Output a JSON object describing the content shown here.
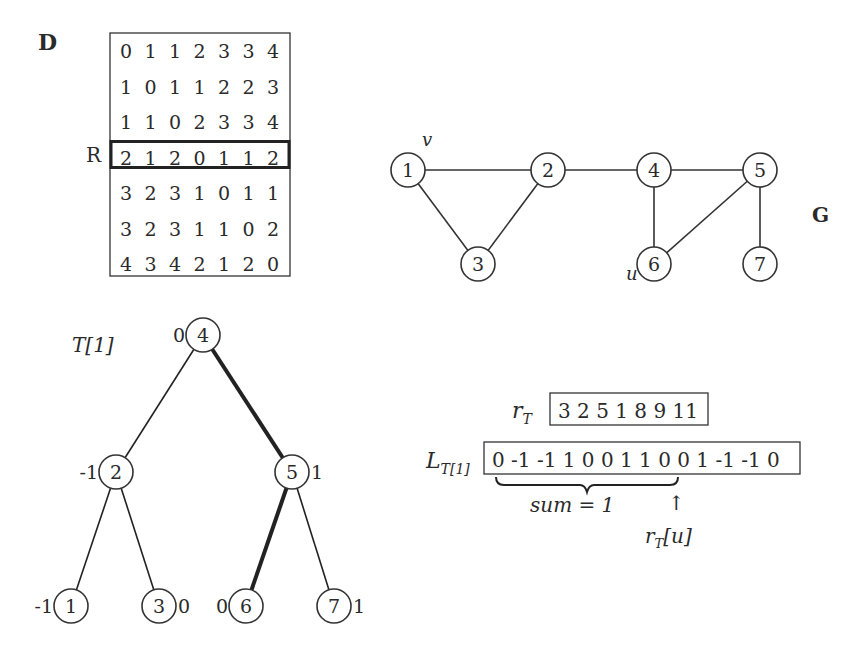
{
  "matrix": {
    "label": "D",
    "row_label": "R",
    "highlight_row": 3,
    "rows": [
      [
        "0",
        "1",
        "1",
        "2",
        "3",
        "3",
        "4"
      ],
      [
        "1",
        "0",
        "1",
        "1",
        "2",
        "2",
        "3"
      ],
      [
        "1",
        "1",
        "0",
        "2",
        "3",
        "3",
        "4"
      ],
      [
        "2",
        "1",
        "2",
        "0",
        "1",
        "1",
        "2"
      ],
      [
        "3",
        "2",
        "3",
        "1",
        "0",
        "1",
        "1"
      ],
      [
        "3",
        "2",
        "3",
        "1",
        "1",
        "0",
        "2"
      ],
      [
        "4",
        "3",
        "4",
        "2",
        "1",
        "2",
        "0"
      ]
    ]
  },
  "graph": {
    "label": "G",
    "nodes": [
      {
        "id": "1",
        "x": 408,
        "y": 170,
        "annotation": "v"
      },
      {
        "id": "2",
        "x": 548,
        "y": 170,
        "annotation": ""
      },
      {
        "id": "3",
        "x": 478,
        "y": 264,
        "annotation": ""
      },
      {
        "id": "4",
        "x": 654,
        "y": 170,
        "annotation": ""
      },
      {
        "id": "5",
        "x": 760,
        "y": 170,
        "annotation": ""
      },
      {
        "id": "6",
        "x": 654,
        "y": 264,
        "annotation": "u"
      },
      {
        "id": "7",
        "x": 760,
        "y": 264,
        "annotation": ""
      }
    ],
    "edges": [
      [
        "1",
        "2"
      ],
      [
        "1",
        "3"
      ],
      [
        "2",
        "3"
      ],
      [
        "2",
        "4"
      ],
      [
        "4",
        "5"
      ],
      [
        "4",
        "6"
      ],
      [
        "5",
        "6"
      ],
      [
        "5",
        "7"
      ]
    ]
  },
  "tree": {
    "label": "T[1]",
    "nodes": [
      {
        "id": "4",
        "x": 203,
        "y": 335,
        "value": "0",
        "value_side": "left"
      },
      {
        "id": "2",
        "x": 116,
        "y": 472,
        "value": "-1",
        "value_side": "left"
      },
      {
        "id": "5",
        "x": 292,
        "y": 472,
        "value": "1",
        "value_side": "right"
      },
      {
        "id": "1",
        "x": 71,
        "y": 606,
        "value": "-1",
        "value_side": "left"
      },
      {
        "id": "3",
        "x": 159,
        "y": 606,
        "value": "0",
        "value_side": "right"
      },
      {
        "id": "6",
        "x": 246,
        "y": 606,
        "value": "0",
        "value_side": "left"
      },
      {
        "id": "7",
        "x": 334,
        "y": 606,
        "value": "1",
        "value_side": "right"
      }
    ],
    "edges": [
      {
        "from": "4",
        "to": "2",
        "bold": false
      },
      {
        "from": "4",
        "to": "5",
        "bold": true
      },
      {
        "from": "2",
        "to": "1",
        "bold": false
      },
      {
        "from": "2",
        "to": "3",
        "bold": false
      },
      {
        "from": "5",
        "to": "6",
        "bold": true
      },
      {
        "from": "5",
        "to": "7",
        "bold": false
      }
    ]
  },
  "arrays": {
    "rT_label": "r",
    "rT_sub": "T",
    "rT_values": "3 2 5 1 8 9 11",
    "LT_label": "L",
    "LT_sub": "T[1]",
    "LT_values": "0 -1 -1 1 0 0 1 1 0 0 1 -1 -1 0",
    "brace_label": "sum = 1",
    "pointer_label_base": "r",
    "pointer_label_sub": "T",
    "pointer_label_arg": "[u]",
    "pointer_arrow": "↑"
  }
}
